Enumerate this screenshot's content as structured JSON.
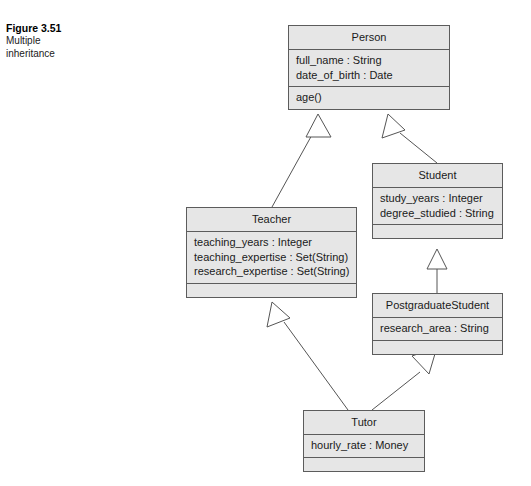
{
  "caption": {
    "figure_number": "Figure 3.51",
    "description_line1": "Multiple",
    "description_line2": "inheritance"
  },
  "diagram": {
    "type": "uml-class-diagram",
    "colors": {
      "class_fill": "#e6e6e6",
      "class_border": "#5c5c5c",
      "edge": "#555555",
      "arrow_fill": "#ffffff",
      "background": "#ffffff"
    },
    "classes": [
      {
        "id": "person",
        "name": "Person",
        "attributes": [
          "full_name : String",
          "date_of_birth : Date"
        ],
        "operations": [
          "age()"
        ]
      },
      {
        "id": "student",
        "name": "Student",
        "attributes": [
          "study_years : Integer",
          "degree_studied : String"
        ],
        "operations": []
      },
      {
        "id": "teacher",
        "name": "Teacher",
        "attributes": [
          "teaching_years : Integer",
          "teaching_expertise : Set(String)",
          "research_expertise : Set(String)"
        ],
        "operations": []
      },
      {
        "id": "postgraduatestudent",
        "name": "PostgraduateStudent",
        "attributes": [
          "research_area : String"
        ],
        "operations": []
      },
      {
        "id": "tutor",
        "name": "Tutor",
        "attributes": [
          "hourly_rate : Money"
        ],
        "operations": []
      }
    ],
    "generalizations": [
      {
        "id": "teacher-person",
        "from": "Teacher",
        "to": "Person"
      },
      {
        "id": "student-person",
        "from": "Student",
        "to": "Person"
      },
      {
        "id": "postgraduatestudent-student",
        "from": "PostgraduateStudent",
        "to": "Student"
      },
      {
        "id": "tutor-teacher",
        "from": "Tutor",
        "to": "Teacher"
      },
      {
        "id": "tutor-postgraduatestudent",
        "from": "Tutor",
        "to": "PostgraduateStudent"
      }
    ]
  }
}
